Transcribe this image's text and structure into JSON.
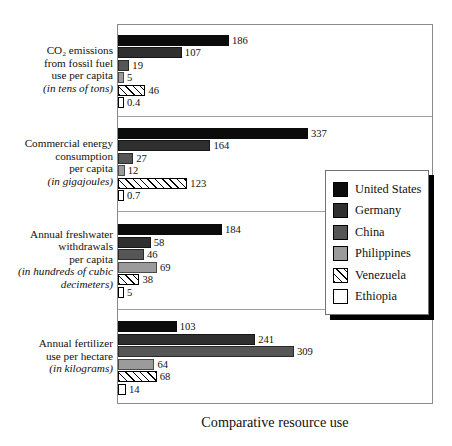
{
  "chart_data": {
    "type": "bar",
    "orientation": "horizontal",
    "title": "Comparative resource use",
    "xlabel": "",
    "ylabel": "",
    "grid": false,
    "legend_position": "middle-right",
    "note": "Each category group is scaled independently; bar lengths are not on a shared axis.",
    "series": [
      {
        "name": "United States",
        "color": "#0b0b0b",
        "fill": "solid",
        "values": [
          186,
          337,
          184,
          103
        ]
      },
      {
        "name": "Germany",
        "color": "#2f2f2f",
        "fill": "solid",
        "values": [
          107,
          164,
          58,
          241
        ]
      },
      {
        "name": "China",
        "color": "#565656",
        "fill": "solid",
        "values": [
          19,
          27,
          46,
          309
        ]
      },
      {
        "name": "Philippines",
        "color": "#9b9b9b",
        "fill": "solid",
        "values": [
          5,
          12,
          69,
          64
        ]
      },
      {
        "name": "Venezuela",
        "color": "#ffffff",
        "fill": "hatched",
        "values": [
          46,
          123,
          38,
          68
        ]
      },
      {
        "name": "Ethiopia",
        "color": "#ffffff",
        "fill": "empty",
        "values": [
          0.4,
          0.7,
          5,
          14
        ]
      }
    ],
    "categories": [
      {
        "id": "co2",
        "lines": [
          "CO₂ emissions",
          "from fossil fuel",
          "use per capita"
        ],
        "unit_line": "(in tens of tons)",
        "values": [
          186,
          107,
          19,
          5,
          46,
          0.4
        ],
        "value_labels": [
          "186",
          "107",
          "19",
          "5",
          "46",
          "0.4"
        ]
      },
      {
        "id": "energy",
        "lines": [
          "Commercial energy",
          "consumption",
          "per capita"
        ],
        "unit_line": "(in gigajoules)",
        "values": [
          337,
          164,
          27,
          12,
          123,
          0.7
        ],
        "value_labels": [
          "337",
          "164",
          "27",
          "12",
          "123",
          "0.7"
        ]
      },
      {
        "id": "freshwater",
        "lines": [
          "Annual freshwater",
          "withdrawals",
          "per capita"
        ],
        "unit_line": "(in hundreds of cubic",
        "unit_line2": "decimeters)",
        "values": [
          184,
          58,
          46,
          69,
          38,
          5
        ],
        "value_labels": [
          "184",
          "58",
          "46",
          "69",
          "38",
          "5"
        ]
      },
      {
        "id": "fertilizer",
        "lines": [
          "Annual fertilizer",
          "use per hectare"
        ],
        "unit_line": "(in kilograms)",
        "values": [
          103,
          241,
          309,
          64,
          68,
          14
        ],
        "value_labels": [
          "103",
          "241",
          "309",
          "64",
          "68",
          "14"
        ]
      }
    ]
  },
  "legend": {
    "items": [
      {
        "label": "United States"
      },
      {
        "label": "Germany"
      },
      {
        "label": "China"
      },
      {
        "label": "Philippines"
      },
      {
        "label": "Venezuela"
      },
      {
        "label": "Ethiopia"
      }
    ]
  },
  "title": {
    "text": "Comparative resource use"
  }
}
